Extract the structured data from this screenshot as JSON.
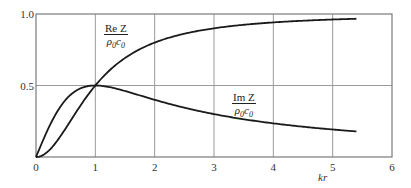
{
  "chart_data": {
    "type": "line",
    "title": "",
    "xlabel": "kr",
    "ylabel": "",
    "xlim": [
      0,
      6
    ],
    "ylim": [
      0,
      1.0
    ],
    "x_ticks": [
      "0",
      "1",
      "2",
      "3",
      "4",
      "5",
      "6"
    ],
    "y_ticks": [
      "0.5",
      "1.0"
    ],
    "grid": true,
    "series": [
      {
        "name": "Re Z / ρ0c0",
        "label_num": "Re Z",
        "label_den": "ρ0c0",
        "formula": "(kr)^2/(1+(kr)^2)",
        "x": [
          0,
          0.25,
          0.5,
          0.75,
          1,
          1.5,
          2,
          2.5,
          3,
          3.5,
          4,
          4.5,
          5,
          5.4
        ],
        "values": [
          0,
          0.059,
          0.2,
          0.36,
          0.5,
          0.692,
          0.8,
          0.862,
          0.9,
          0.925,
          0.941,
          0.953,
          0.962,
          0.967
        ]
      },
      {
        "name": "Im Z / ρ0c0",
        "label_num": "Im Z",
        "label_den": "ρ0c0",
        "formula": "kr/(1+(kr)^2)",
        "x": [
          0,
          0.25,
          0.5,
          0.75,
          1,
          1.5,
          2,
          2.5,
          3,
          3.5,
          4,
          4.5,
          5,
          5.4
        ],
        "values": [
          0,
          0.235,
          0.4,
          0.48,
          0.5,
          0.462,
          0.4,
          0.345,
          0.3,
          0.264,
          0.235,
          0.212,
          0.192,
          0.179
        ]
      }
    ]
  }
}
